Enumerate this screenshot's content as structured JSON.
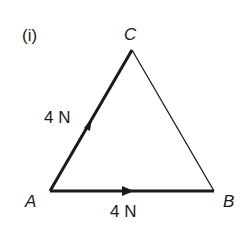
{
  "figure": {
    "part_label": "(i)",
    "vertices": {
      "A": {
        "label": "A",
        "x": 50,
        "y": 191
      },
      "B": {
        "label": "B",
        "x": 214,
        "y": 191
      },
      "C": {
        "label": "C",
        "x": 132,
        "y": 50
      }
    },
    "forces": [
      {
        "from": "A",
        "to": "C",
        "magnitude_label": "4 N"
      },
      {
        "from": "A",
        "to": "B",
        "magnitude_label": "4 N"
      }
    ],
    "side_BC": "plain line",
    "colors": {
      "line": "#1a1a1a",
      "background": "#ffffff"
    }
  }
}
